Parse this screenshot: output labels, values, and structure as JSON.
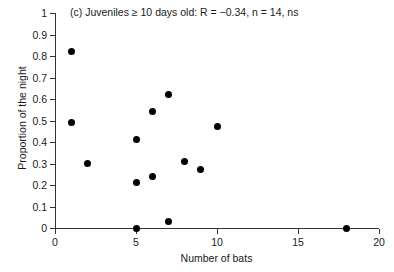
{
  "chart_data": {
    "type": "scatter",
    "title": "(c) Juveniles ≥ 10 days old: R = −0.34, n = 14, ns",
    "xlabel": "Number of bats",
    "ylabel": "Proportion of the night",
    "xlim": [
      0,
      20
    ],
    "ylim": [
      0,
      1
    ],
    "grid": false,
    "legend": null,
    "xticks": [
      0,
      5,
      10,
      15,
      20
    ],
    "xtick_labels": [
      "0",
      "5",
      "10",
      "15",
      "20"
    ],
    "yticks": [
      0,
      0.1,
      0.2,
      0.3,
      0.4,
      0.5,
      0.6,
      0.7,
      0.8,
      0.9,
      1
    ],
    "ytick_labels": [
      "0",
      "0.1",
      "0.2",
      "0.3",
      "0.4",
      "0.5",
      "0.6",
      "0.7",
      "0.8",
      "0.9",
      "1"
    ],
    "marker": "filled-circle",
    "marker_color": "#000000",
    "annotations": {
      "R": "−0.34",
      "n": "14",
      "significance": "ns"
    },
    "points": [
      {
        "x": 1,
        "y": 0.82
      },
      {
        "x": 1,
        "y": 0.49
      },
      {
        "x": 2,
        "y": 0.3
      },
      {
        "x": 5,
        "y": 0.41
      },
      {
        "x": 5,
        "y": 0.21
      },
      {
        "x": 5,
        "y": 0.0
      },
      {
        "x": 6,
        "y": 0.54
      },
      {
        "x": 6,
        "y": 0.24
      },
      {
        "x": 7,
        "y": 0.62
      },
      {
        "x": 7,
        "y": 0.03
      },
      {
        "x": 8,
        "y": 0.31
      },
      {
        "x": 9,
        "y": 0.27
      },
      {
        "x": 10,
        "y": 0.47
      },
      {
        "x": 18,
        "y": 0.0
      }
    ]
  }
}
